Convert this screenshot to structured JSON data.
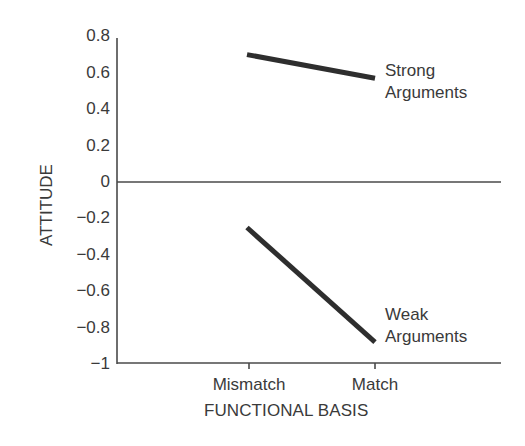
{
  "chart_data": {
    "type": "line",
    "title": "",
    "xlabel": "FUNCTIONAL BASIS",
    "ylabel": "ATTITUDE",
    "categories": [
      "Mismatch",
      "Match"
    ],
    "series": [
      {
        "name": "Strong Arguments",
        "values": [
          0.7,
          0.57
        ]
      },
      {
        "name": "Weak Arguments",
        "values": [
          -0.25,
          -0.88
        ]
      }
    ],
    "ylim": [
      -1,
      0.8
    ],
    "yticks": [
      "0.8",
      "0.6",
      "0.4",
      "0.2",
      "0",
      "−0.2",
      "−0.4",
      "−0.6",
      "−0.8",
      "−1"
    ],
    "grid": false,
    "reference_line": 0,
    "legend_position": "inline labels at line ends"
  },
  "labels": {
    "strong_line1": "Strong",
    "strong_line2": "Arguments",
    "weak_line1": "Weak",
    "weak_line2": "Arguments"
  },
  "colors": {
    "line": "#2e2e2e",
    "axis": "#4a4a4a",
    "text": "#3a3a3a"
  }
}
